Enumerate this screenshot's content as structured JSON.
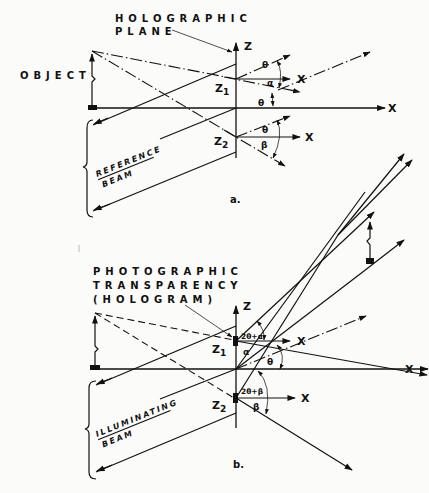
{
  "figure_a": {
    "caption": "a.",
    "labels": {
      "holographic_line1": "HOLOGRAPHIC",
      "holographic_line2": "PLANE",
      "object": "OBJECT",
      "reference_line1": "REFERENCE",
      "reference_line2": "BEAM",
      "z_axis": "Z",
      "x_axis": "X",
      "x1": "X",
      "x2": "X",
      "z1": "Z",
      "z1_sub": "1",
      "z2": "Z",
      "z2_sub": "2",
      "theta_top": "θ",
      "alpha": "α",
      "theta_mid": "θ",
      "theta_bot": "θ",
      "beta": "β"
    }
  },
  "figure_b": {
    "caption": "b.",
    "labels": {
      "transparency_line1": "PHOTOGRAPHIC",
      "transparency_line2": "TRANSPARENCY",
      "transparency_line3": "(HOLOGRAM)",
      "illuminating_line1": "ILLUMINATING",
      "illuminating_line2": "BEAM",
      "z_axis": "Z",
      "x_axis": "X",
      "x1": "X",
      "x2": "X",
      "z1": "Z",
      "z1_sub": "1",
      "z2": "Z",
      "z2_sub": "2",
      "angle_top": "2θ+α",
      "alpha": "α",
      "theta": "θ",
      "angle_bot": "2θ+β",
      "beta": "β"
    }
  }
}
